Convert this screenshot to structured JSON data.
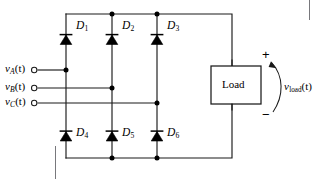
{
  "figure": {
    "background_color": "#ffffff",
    "line_color": "#1a1a1a"
  },
  "sources": [
    {
      "id": "phase-a",
      "label_v": "v",
      "label_sub": "A",
      "label_paren": "(t)",
      "terminal": "open-circle"
    },
    {
      "id": "phase-b",
      "label_v": "v",
      "label_sub": "B",
      "label_paren": "(t)",
      "terminal": "open-circle"
    },
    {
      "id": "phase-c",
      "label_v": "v",
      "label_sub": "C",
      "label_paren": "(t)",
      "terminal": "open-circle"
    }
  ],
  "diodes": {
    "top_row": [
      {
        "id": "D1",
        "letter": "D",
        "sub": "1",
        "direction": "up"
      },
      {
        "id": "D2",
        "letter": "D",
        "sub": "2",
        "direction": "up"
      },
      {
        "id": "D3",
        "letter": "D",
        "sub": "3",
        "direction": "up"
      }
    ],
    "bottom_row": [
      {
        "id": "D4",
        "letter": "D",
        "sub": "4",
        "direction": "up"
      },
      {
        "id": "D5",
        "letter": "D",
        "sub": "5",
        "direction": "up"
      },
      {
        "id": "D6",
        "letter": "D",
        "sub": "6",
        "direction": "up"
      }
    ]
  },
  "load": {
    "label": "Load",
    "polarity_positive": "+",
    "polarity_negative": "−"
  },
  "output": {
    "label_v": "v",
    "label_sub": "load",
    "label_paren": "(t)",
    "arrow_direction": "up"
  }
}
